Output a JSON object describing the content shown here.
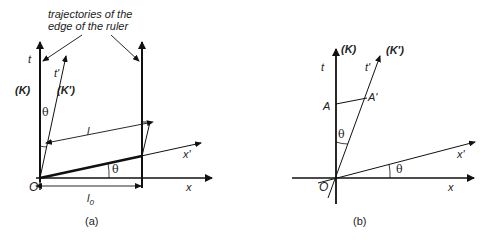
{
  "annotation": {
    "line1": "trajectories of the",
    "line2": "edge of the ruler"
  },
  "panel_a": {
    "caption": "(a)",
    "t_label": "t",
    "t_prime_label": "t'",
    "K_label": "(K)",
    "K_prime_label": "(K')",
    "theta_top": "θ",
    "theta_bottom": "θ",
    "l_label": "l",
    "l0_label": "l",
    "l0_sub": "0",
    "x_label": "x",
    "x_prime_label": "x'",
    "origin_label": "O"
  },
  "panel_b": {
    "caption": "(b)",
    "t_label": "t",
    "t_prime_label": "t'",
    "K_label": "(K)",
    "K_prime_label": "(K')",
    "A_label": "A",
    "A_prime_label": "A'",
    "theta_top": "θ",
    "theta_bottom": "θ",
    "x_label": "x",
    "x_prime_label": "x'",
    "origin_label": "O"
  }
}
